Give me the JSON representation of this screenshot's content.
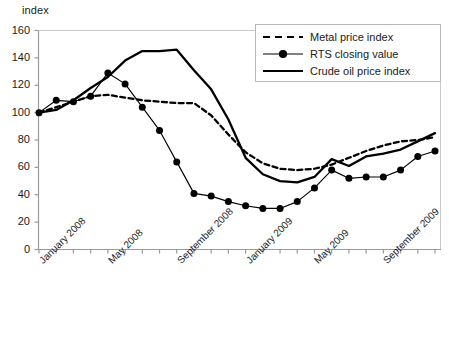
{
  "chart_data": {
    "type": "line",
    "title": "",
    "xlabel": "",
    "ylabel": "index",
    "ylim": [
      0,
      160
    ],
    "ytick_step": 20,
    "yticks": [
      0,
      20,
      40,
      60,
      80,
      100,
      120,
      140,
      160
    ],
    "grid": false,
    "legend_position": "top-right",
    "x": [
      "January 2008",
      "February 2008",
      "March 2008",
      "April 2008",
      "May 2008",
      "June 2008",
      "July 2008",
      "August 2008",
      "September 2008",
      "October 2008",
      "November 2008",
      "December 2008",
      "January 2009",
      "February 2009",
      "March 2009",
      "April 2009",
      "May 2009",
      "June 2009",
      "July 2009",
      "August 2009",
      "September 2009",
      "October 2009",
      "November 2009",
      "December 2009"
    ],
    "xtick_labels": [
      "January 2008",
      "May 2008",
      "September 2008",
      "January 2009",
      "May 2009",
      "September 2009"
    ],
    "xtick_label_indices": [
      0,
      4,
      8,
      12,
      16,
      20
    ],
    "series": [
      {
        "name": "Metal price index",
        "style": "dashed",
        "color": "#000000",
        "markers": false,
        "values": [
          100,
          104,
          108,
          112,
          113,
          111,
          109,
          108,
          107,
          107,
          98,
          84,
          71,
          63,
          59,
          58,
          59,
          62,
          67,
          72,
          76,
          79,
          80,
          82
        ]
      },
      {
        "name": "RTS closing value",
        "style": "solid-with-markers",
        "color": "#000000",
        "markers": true,
        "values": [
          100,
          109,
          108,
          112,
          129,
          121,
          104,
          87,
          64,
          41,
          39,
          35,
          32,
          30,
          30,
          35,
          45,
          58,
          52,
          53,
          53,
          58,
          68,
          72
        ]
      },
      {
        "name": "Crude oil price index",
        "style": "solid",
        "color": "#000000",
        "markers": false,
        "values": [
          100,
          102,
          109,
          118,
          126,
          138,
          145,
          145,
          146,
          131,
          117,
          95,
          67,
          55,
          50,
          49,
          53,
          66,
          61,
          68,
          70,
          73,
          79,
          85
        ]
      }
    ]
  },
  "legend": {
    "items": [
      {
        "label": "Metal price index",
        "swatch": "dashed-line"
      },
      {
        "label": "RTS closing value",
        "swatch": "line-with-dot-marker"
      },
      {
        "label": "Crude oil price index",
        "swatch": "solid-line"
      }
    ]
  },
  "axes": {
    "y_unit_label": "index"
  }
}
